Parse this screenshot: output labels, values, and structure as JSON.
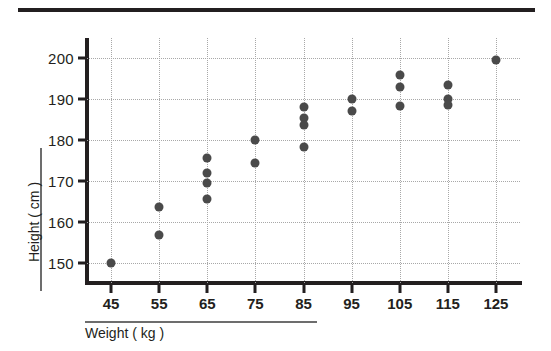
{
  "figure": {
    "top_rule": "decorative-rule"
  },
  "chart_data": {
    "type": "scatter",
    "title": "",
    "xlabel": "Weight ( kg )",
    "ylabel": "Height ( cm )",
    "xlim": [
      40,
      130
    ],
    "ylim": [
      145,
      205
    ],
    "grid": true,
    "legend": null,
    "xticks": [
      45,
      55,
      65,
      75,
      85,
      95,
      105,
      115,
      125
    ],
    "xtick_labels": [
      "45",
      "55",
      "65",
      "75",
      "85",
      "95",
      "105",
      "115",
      "125"
    ],
    "yticks": [
      150,
      160,
      170,
      180,
      190,
      200
    ],
    "ytick_labels": [
      "150",
      "160",
      "170",
      "180",
      "190",
      "200"
    ],
    "marker_color": "#4a4a4a",
    "points": [
      {
        "x": 45,
        "y": 150.0
      },
      {
        "x": 55,
        "y": 163.6
      },
      {
        "x": 55,
        "y": 156.7
      },
      {
        "x": 65,
        "y": 175.5
      },
      {
        "x": 65,
        "y": 172.0
      },
      {
        "x": 65,
        "y": 169.6
      },
      {
        "x": 65,
        "y": 165.5
      },
      {
        "x": 75,
        "y": 180.0
      },
      {
        "x": 75,
        "y": 174.3
      },
      {
        "x": 85,
        "y": 188.0
      },
      {
        "x": 85,
        "y": 185.3
      },
      {
        "x": 85,
        "y": 183.8
      },
      {
        "x": 85,
        "y": 178.2
      },
      {
        "x": 95,
        "y": 190.0
      },
      {
        "x": 95,
        "y": 187.2
      },
      {
        "x": 105,
        "y": 196.0
      },
      {
        "x": 105,
        "y": 193.0
      },
      {
        "x": 105,
        "y": 188.3
      },
      {
        "x": 115,
        "y": 193.6
      },
      {
        "x": 115,
        "y": 190.0
      },
      {
        "x": 115,
        "y": 188.5
      },
      {
        "x": 125,
        "y": 199.5
      }
    ]
  }
}
